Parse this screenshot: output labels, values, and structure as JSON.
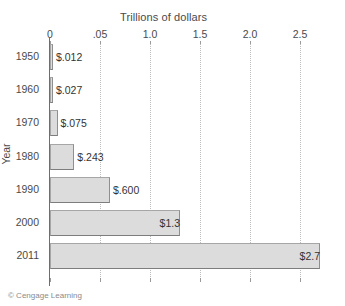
{
  "chart_data": {
    "type": "bar",
    "orientation": "horizontal",
    "title": "Trillions of dollars",
    "xlabel": "Trillions of dollars",
    "ylabel": "Year",
    "categories": [
      "1950",
      "1960",
      "1970",
      "1980",
      "1990",
      "2000",
      "2011"
    ],
    "values": [
      0.012,
      0.027,
      0.075,
      0.243,
      0.6,
      1.3,
      2.7
    ],
    "value_labels": [
      "$.012",
      "$.027",
      "$.075",
      "$.243",
      "$.600",
      "$1.3",
      "$2.7"
    ],
    "xlim": [
      0,
      2.85
    ],
    "xticks": [
      0,
      0.5,
      1.0,
      1.5,
      2.0,
      2.5
    ],
    "xtick_labels": [
      "0",
      ".05",
      "1.0",
      "1.5",
      "2.0",
      "2.5"
    ],
    "grid": "vertical-dotted",
    "legend": "none",
    "bar_color": "#dcdcdc",
    "bar_border_color": "#a6a6a6",
    "gridline_color": "#bdbdbd",
    "axis_color": "#6e6e6e",
    "text_color": "#4a4a4a"
  },
  "footer": {
    "credit": "© Cengage Learning"
  }
}
